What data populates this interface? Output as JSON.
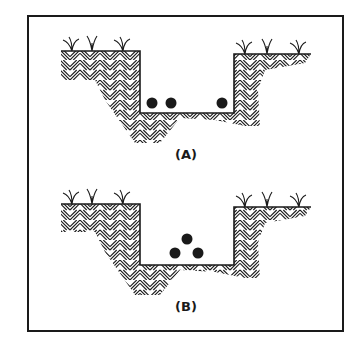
{
  "diagram": {
    "frame": {
      "x": 28,
      "y": 16,
      "width": 315,
      "height": 315,
      "stroke": "#1a1a1a",
      "stroke_width": 2
    },
    "colors": {
      "ink": "#1a1a1a",
      "background": "#ffffff",
      "ball": "#1a1a1a"
    },
    "panels": [
      {
        "id": "A",
        "label": "(A)",
        "label_pos": {
          "x": 186,
          "y": 159
        },
        "ground_y": 51,
        "ground_right_y": 54,
        "trench": {
          "left_x": 140,
          "right_x": 234,
          "floor_y": 113
        },
        "balls": [
          {
            "cx": 152,
            "cy": 103,
            "r": 5.5
          },
          {
            "cx": 171,
            "cy": 103,
            "r": 5.5
          },
          {
            "cx": 222,
            "cy": 103,
            "r": 5.5
          }
        ],
        "arrangement": "three balls in a row on trench floor, two left, one right"
      },
      {
        "id": "B",
        "label": "(B)",
        "label_pos": {
          "x": 186,
          "y": 311
        },
        "ground_y": 204,
        "ground_right_y": 207,
        "trench": {
          "left_x": 140,
          "right_x": 234,
          "floor_y": 265
        },
        "balls": [
          {
            "cx": 187,
            "cy": 239,
            "r": 5.5
          },
          {
            "cx": 175,
            "cy": 253,
            "r": 5.5
          },
          {
            "cx": 198,
            "cy": 253,
            "r": 5.5
          }
        ],
        "arrangement": "three balls stacked in a triangle pyramid"
      }
    ]
  }
}
